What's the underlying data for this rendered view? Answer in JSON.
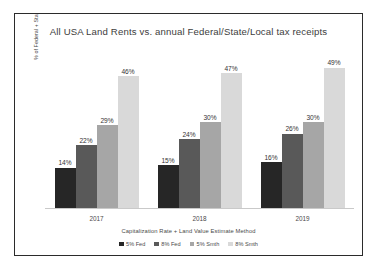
{
  "chart_data": {
    "type": "bar",
    "title": "All USA Land Rents vs. annual Federal/State/Local tax receipts",
    "xlabel": "Capitalization Rate + Land Value Estimate Method",
    "ylabel": "% of Federal + State + Local Tax Receipts",
    "categories": [
      "2017",
      "2018",
      "2019"
    ],
    "series": [
      {
        "name": "5% Fed",
        "color": "#262626",
        "values": [
          14,
          22,
          29
        ]
      },
      {
        "name": "8% Fed",
        "color": "#595959",
        "values": [
          22,
          24,
          26
        ]
      },
      {
        "name": "5% Smth",
        "color": "#a6a6a6",
        "values": [
          29,
          30,
          30
        ]
      },
      {
        "name": "8% Smth",
        "color": "#d9d9d9",
        "values": [
          46,
          47,
          49
        ]
      }
    ],
    "groups": [
      {
        "category": "2017",
        "bars": [
          {
            "series": "5% Fed",
            "value": 14,
            "label": "14%",
            "color": "#262626"
          },
          {
            "series": "8% Fed",
            "value": 22,
            "label": "22%",
            "color": "#595959"
          },
          {
            "series": "5% Smth",
            "value": 29,
            "label": "29%",
            "color": "#a6a6a6"
          },
          {
            "series": "8% Smth",
            "value": 46,
            "label": "46%",
            "color": "#d9d9d9"
          }
        ]
      },
      {
        "category": "2018",
        "bars": [
          {
            "series": "5% Fed",
            "value": 15,
            "label": "15%",
            "color": "#262626"
          },
          {
            "series": "8% Fed",
            "value": 24,
            "label": "24%",
            "color": "#595959"
          },
          {
            "series": "5% Smth",
            "value": 30,
            "label": "30%",
            "color": "#a6a6a6"
          },
          {
            "series": "8% Smth",
            "value": 47,
            "label": "47%",
            "color": "#d9d9d9"
          }
        ]
      },
      {
        "category": "2019",
        "bars": [
          {
            "series": "5% Fed",
            "value": 16,
            "label": "16%",
            "color": "#262626"
          },
          {
            "series": "8% Fed",
            "value": 26,
            "label": "26%",
            "color": "#595959"
          },
          {
            "series": "5% Smth",
            "value": 30,
            "label": "30%",
            "color": "#a6a6a6"
          },
          {
            "series": "8% Smth",
            "value": 49,
            "label": "49%",
            "color": "#d9d9d9"
          }
        ]
      }
    ],
    "ylim": [
      0,
      58
    ],
    "grid": false,
    "y_axis_ticks_visible": false,
    "legend_position": "bottom",
    "legend": [
      {
        "label": "5% Fed",
        "color": "#262626"
      },
      {
        "label": "8% Fed",
        "color": "#595959"
      },
      {
        "label": "5% Smth",
        "color": "#a6a6a6"
      },
      {
        "label": "8% Smth",
        "color": "#d9d9d9"
      }
    ],
    "data_labels_shown": true,
    "border_color": "#2b2b2b",
    "background_color": "#ffffff"
  }
}
